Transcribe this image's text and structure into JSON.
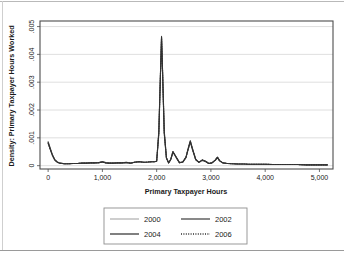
{
  "figure": {
    "name": "density-plot-primary-taxpayer-hours",
    "background": "#ffffff",
    "frame_color": "#4d4d4d",
    "grid_color": "#d7d7d7"
  },
  "chart_data": {
    "type": "line",
    "title": "",
    "xlabel": "Primary Taxpayer Hours",
    "ylabel": "Density: Primary Taxpayer Hours Worked",
    "xlim": [
      -150,
      5250
    ],
    "ylim": [
      -0.00012,
      0.0052
    ],
    "xticks": [
      0,
      1000,
      2000,
      3000,
      4000,
      5000
    ],
    "xticklabels": [
      "0",
      "1,000",
      "2,000",
      "3,000",
      "4,000",
      "5,000"
    ],
    "yticks": [
      0,
      0.001,
      0.002,
      0.003,
      0.004,
      0.005
    ],
    "yticklabels": [
      "0",
      ".001",
      ".002",
      ".003",
      ".004",
      ".005"
    ],
    "grid": "horizontal",
    "legend_position": "below-center",
    "series": [
      {
        "name": "2000",
        "color": "#b4b4b4",
        "dash": "none",
        "width": 1.1,
        "x": [
          0,
          40,
          80,
          120,
          170,
          220,
          300,
          380,
          460,
          540,
          620,
          700,
          780,
          860,
          940,
          1000,
          1060,
          1120,
          1200,
          1280,
          1360,
          1440,
          1520,
          1600,
          1680,
          1760,
          1840,
          1900,
          1960,
          2000,
          2040,
          2070,
          2090,
          2110,
          2140,
          2180,
          2220,
          2260,
          2300,
          2360,
          2420,
          2480,
          2540,
          2580,
          2620,
          2660,
          2720,
          2780,
          2840,
          2900,
          2960,
          3020,
          3080,
          3120,
          3160,
          3220,
          3300,
          3400,
          3500,
          3600,
          3700,
          3800,
          3900,
          4000,
          4150,
          4300,
          4450,
          4600,
          4750,
          4900,
          5050,
          5150
        ],
        "y": [
          0.00084,
          0.0006,
          0.00038,
          0.00022,
          0.00013,
          9e-05,
          7e-05,
          7e-05,
          8e-05,
          8e-05,
          9e-05,
          9e-05,
          0.0001,
          0.0001,
          0.00011,
          0.00014,
          0.00011,
          9e-05,
          9e-05,
          0.0001,
          0.0001,
          0.00012,
          9e-05,
          0.00013,
          0.00015,
          0.00012,
          0.00013,
          0.00014,
          0.00014,
          0.00016,
          0.0012,
          0.0033,
          0.00463,
          0.0033,
          0.0012,
          0.00028,
          0.0001,
          0.00022,
          0.0005,
          0.0003,
          0.00011,
          0.00013,
          0.0003,
          0.0006,
          0.00088,
          0.0006,
          0.00022,
          0.00012,
          0.0002,
          0.00016,
          8e-05,
          0.0001,
          0.0002,
          0.0003,
          0.00018,
          0.0001,
          8e-05,
          7e-05,
          6e-05,
          6e-05,
          5e-05,
          5e-05,
          5e-05,
          5e-05,
          4e-05,
          4e-05,
          4e-05,
          4e-05,
          3e-05,
          3e-05,
          3e-05,
          3e-05
        ]
      },
      {
        "name": "2002",
        "color": "#4a4a4a",
        "dash": "none",
        "width": 1.1,
        "x": [
          0,
          40,
          80,
          120,
          170,
          220,
          300,
          380,
          460,
          540,
          620,
          700,
          780,
          860,
          940,
          1000,
          1060,
          1120,
          1200,
          1280,
          1360,
          1440,
          1520,
          1600,
          1680,
          1760,
          1840,
          1900,
          1960,
          2000,
          2040,
          2070,
          2090,
          2110,
          2140,
          2180,
          2220,
          2260,
          2300,
          2360,
          2420,
          2480,
          2540,
          2580,
          2620,
          2660,
          2720,
          2780,
          2840,
          2900,
          2960,
          3020,
          3080,
          3120,
          3160,
          3220,
          3300,
          3400,
          3500,
          3600,
          3700,
          3800,
          3900,
          4000,
          4150,
          4300,
          4450,
          4600,
          4750,
          4900,
          5050,
          5150
        ],
        "y": [
          0.00086,
          0.00062,
          0.00039,
          0.00023,
          0.00013,
          9e-05,
          7e-05,
          7e-05,
          8e-05,
          8e-05,
          9e-05,
          9e-05,
          0.0001,
          0.0001,
          0.00011,
          0.00015,
          0.00011,
          9e-05,
          9e-05,
          0.0001,
          0.0001,
          0.00012,
          9e-05,
          0.00013,
          0.00015,
          0.00012,
          0.00013,
          0.00014,
          0.00014,
          0.00016,
          0.00125,
          0.00335,
          0.00465,
          0.00335,
          0.00125,
          0.00029,
          0.0001,
          0.00023,
          0.00051,
          0.00031,
          0.00011,
          0.00013,
          0.00031,
          0.00062,
          0.0009,
          0.00062,
          0.00023,
          0.00012,
          0.00021,
          0.00016,
          8e-05,
          0.0001,
          0.00021,
          0.00031,
          0.00018,
          0.0001,
          8e-05,
          7e-05,
          6e-05,
          6e-05,
          5e-05,
          5e-05,
          5e-05,
          5e-05,
          4e-05,
          4e-05,
          4e-05,
          4e-05,
          3e-05,
          3e-05,
          3e-05,
          3e-05
        ]
      },
      {
        "name": "2004",
        "color": "#3c3c3c",
        "dash": "none",
        "width": 1.1,
        "x": [
          0,
          40,
          80,
          120,
          170,
          220,
          300,
          380,
          460,
          540,
          620,
          700,
          780,
          860,
          940,
          1000,
          1060,
          1120,
          1200,
          1280,
          1360,
          1440,
          1520,
          1600,
          1680,
          1760,
          1840,
          1900,
          1960,
          2000,
          2040,
          2070,
          2090,
          2110,
          2140,
          2180,
          2220,
          2260,
          2300,
          2360,
          2420,
          2480,
          2540,
          2580,
          2620,
          2660,
          2720,
          2780,
          2840,
          2900,
          2960,
          3020,
          3080,
          3120,
          3160,
          3220,
          3300,
          3400,
          3500,
          3600,
          3700,
          3800,
          3900,
          4000,
          4150,
          4300,
          4450,
          4600,
          4750,
          4900,
          5050,
          5150
        ],
        "y": [
          0.00082,
          0.00058,
          0.00037,
          0.00021,
          0.00012,
          9e-05,
          7e-05,
          7e-05,
          8e-05,
          8e-05,
          9e-05,
          9e-05,
          0.0001,
          0.0001,
          0.00011,
          0.00013,
          0.0001,
          9e-05,
          9e-05,
          0.0001,
          0.0001,
          0.00011,
          9e-05,
          0.00012,
          0.00014,
          0.00012,
          0.00013,
          0.00014,
          0.00014,
          0.00016,
          0.00115,
          0.00325,
          0.0046,
          0.00325,
          0.00115,
          0.00027,
          0.0001,
          0.00022,
          0.00049,
          0.00029,
          0.00011,
          0.00012,
          0.00029,
          0.00058,
          0.00086,
          0.00058,
          0.00021,
          0.00012,
          0.00019,
          0.00015,
          8e-05,
          0.0001,
          0.00019,
          0.00029,
          0.00017,
          0.0001,
          8e-05,
          7e-05,
          6e-05,
          6e-05,
          5e-05,
          5e-05,
          5e-05,
          5e-05,
          4e-05,
          4e-05,
          4e-05,
          4e-05,
          3e-05,
          3e-05,
          3e-05,
          3e-05
        ]
      },
      {
        "name": "2006",
        "color": "#2e2e2e",
        "dash": "1,1.4",
        "width": 1.1,
        "x": [
          0,
          40,
          80,
          120,
          170,
          220,
          300,
          380,
          460,
          540,
          620,
          700,
          780,
          860,
          940,
          1000,
          1060,
          1120,
          1200,
          1280,
          1360,
          1440,
          1520,
          1600,
          1680,
          1760,
          1840,
          1900,
          1960,
          2000,
          2040,
          2070,
          2090,
          2110,
          2140,
          2180,
          2220,
          2260,
          2300,
          2360,
          2420,
          2480,
          2540,
          2580,
          2620,
          2660,
          2720,
          2780,
          2840,
          2900,
          2960,
          3020,
          3080,
          3120,
          3160,
          3220,
          3300,
          3400,
          3500,
          3600,
          3700,
          3800,
          3900,
          4000,
          4150,
          4300,
          4450,
          4600,
          4750,
          4900,
          5050,
          5150
        ],
        "y": [
          0.0008,
          0.00057,
          0.00036,
          0.00021,
          0.00012,
          8e-05,
          7e-05,
          7e-05,
          8e-05,
          8e-05,
          9e-05,
          9e-05,
          0.0001,
          0.0001,
          0.00011,
          0.00013,
          0.0001,
          9e-05,
          9e-05,
          0.0001,
          0.0001,
          0.00011,
          9e-05,
          0.00012,
          0.00014,
          0.00012,
          0.00013,
          0.00014,
          0.00014,
          0.00016,
          0.00118,
          0.00328,
          0.00462,
          0.00328,
          0.00118,
          0.00028,
          0.0001,
          0.00022,
          0.0005,
          0.0003,
          0.00011,
          0.00013,
          0.0003,
          0.00059,
          0.00087,
          0.00059,
          0.00022,
          0.00012,
          0.0002,
          0.00016,
          8e-05,
          0.0001,
          0.0002,
          0.0003,
          0.00018,
          0.0001,
          8e-05,
          7e-05,
          6e-05,
          6e-05,
          5e-05,
          5e-05,
          5e-05,
          5e-05,
          4e-05,
          4e-05,
          4e-05,
          4e-05,
          3e-05,
          3e-05,
          3e-05,
          3e-05
        ]
      }
    ],
    "legend": [
      {
        "label": "2000",
        "color": "#b4b4b4",
        "dash": "none"
      },
      {
        "label": "2002",
        "color": "#4a4a4a",
        "dash": "none"
      },
      {
        "label": "2004",
        "color": "#3c3c3c",
        "dash": "none"
      },
      {
        "label": "2006",
        "color": "#2e2e2e",
        "dash": "1,1.4"
      }
    ]
  }
}
